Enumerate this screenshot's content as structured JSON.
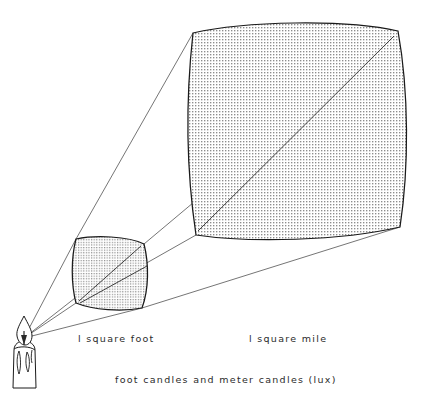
{
  "figure": {
    "title_caption": "foot candles and meter candles (lux)",
    "labels": {
      "small_patch": "l square foot",
      "large_patch": "l square mile"
    },
    "source_name": "candle",
    "colors": {
      "background": "#ffffff",
      "ink": "#1a1a1a",
      "ray": "#3a3a3a",
      "stipple": "#9a9a9a",
      "patch_fill": "#e8e8e8"
    },
    "geometry": {
      "source_point": [
        24,
        338
      ],
      "small_patch_corners": {
        "top_left": [
          76,
          239
        ],
        "top_right": [
          144,
          244
        ],
        "bottom_right": [
          142,
          308
        ],
        "bottom_left": [
          76,
          303
        ]
      },
      "large_patch_corners": {
        "top_left": [
          193,
          33
        ],
        "top_right": [
          398,
          31
        ],
        "bottom_right": [
          400,
          227
        ],
        "bottom_left": [
          196,
          235
        ]
      }
    },
    "icon_names": [
      "candle-icon",
      "flame-icon",
      "light-ray",
      "square-foot-patch",
      "square-mile-patch"
    ]
  }
}
